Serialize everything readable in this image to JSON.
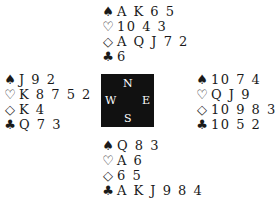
{
  "suits": {
    "spades": "♠",
    "hearts": "♡",
    "diamonds": "◇",
    "clubs": "♣"
  },
  "compass": {
    "n": "N",
    "e": "E",
    "s": "S",
    "w": "W"
  },
  "hands": {
    "north": {
      "spades": "A K 6 5",
      "hearts": "10 4 3",
      "diamonds": "A Q J 7 2",
      "clubs": "6"
    },
    "west": {
      "spades": "J 9 2",
      "hearts": "K 8 7 5 2",
      "diamonds": "K 4",
      "clubs": "Q 7 3"
    },
    "east": {
      "spades": "10 7 4",
      "hearts": "Q J 9",
      "diamonds": "10 9 8 3",
      "clubs": "10 5 2"
    },
    "south": {
      "spades": "Q 8 3",
      "hearts": "A 6",
      "diamonds": "6 5",
      "clubs": "A K J 9 8 4"
    }
  }
}
